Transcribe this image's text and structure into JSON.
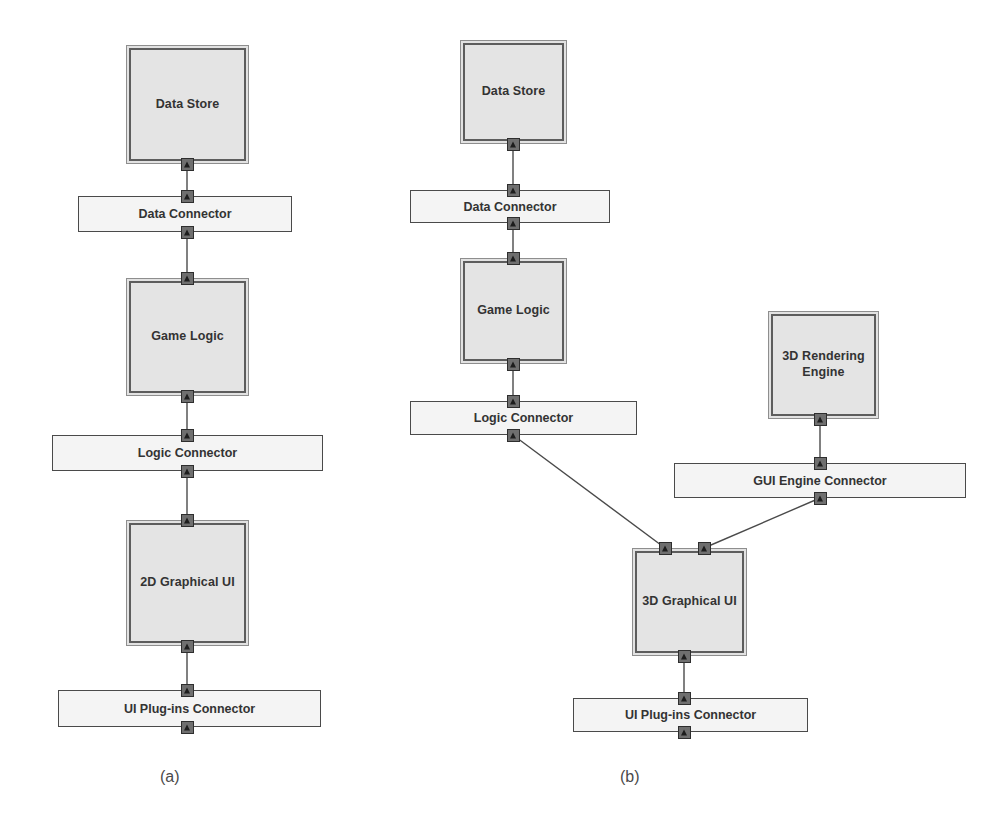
{
  "figure": {
    "background": "#ffffff",
    "component_fill": "#e4e4e4",
    "connector_fill": "#f4f4f4",
    "line_color": "#4a4a4a",
    "port_color": "#6f6f6f"
  },
  "captions": [
    {
      "text": "(a)",
      "x": 160,
      "y": 768
    },
    {
      "text": "(b)",
      "x": 620,
      "y": 768
    }
  ],
  "panels": [
    {
      "id": "panel-a",
      "caption": "(a)",
      "nodes": [
        {
          "id": "a-data-store",
          "kind": "component",
          "label": "Data Store",
          "x": 126,
          "y": 45,
          "w": 123,
          "h": 119,
          "ports": [
            {
              "side": "bottom",
              "cx": 187,
              "cy": 164
            }
          ]
        },
        {
          "id": "a-data-connector",
          "kind": "connector",
          "label": "Data Connector",
          "x": 78,
          "y": 196,
          "w": 214,
          "h": 36,
          "ports": [
            {
              "side": "top",
              "cx": 187,
              "cy": 196
            },
            {
              "side": "bottom",
              "cx": 187,
              "cy": 232
            }
          ]
        },
        {
          "id": "a-game-logic",
          "kind": "component",
          "label": "Game Logic",
          "x": 126,
          "y": 278,
          "w": 123,
          "h": 118,
          "ports": [
            {
              "side": "top",
              "cx": 187,
              "cy": 278
            },
            {
              "side": "bottom",
              "cx": 187,
              "cy": 396
            }
          ]
        },
        {
          "id": "a-logic-connector",
          "kind": "connector",
          "label": "Logic Connector",
          "x": 52,
          "y": 435,
          "w": 271,
          "h": 36,
          "ports": [
            {
              "side": "top",
              "cx": 187,
              "cy": 435
            },
            {
              "side": "bottom",
              "cx": 187,
              "cy": 471
            }
          ]
        },
        {
          "id": "a-2d-graphical-ui",
          "kind": "component",
          "label": "2D Graphical UI",
          "x": 126,
          "y": 520,
          "w": 123,
          "h": 126,
          "ports": [
            {
              "side": "top",
              "cx": 187,
              "cy": 520
            },
            {
              "side": "bottom",
              "cx": 187,
              "cy": 646
            }
          ]
        },
        {
          "id": "a-ui-plugins-connector",
          "kind": "connector",
          "label": "UI Plug-ins Connector",
          "x": 58,
          "y": 690,
          "w": 263,
          "h": 37,
          "ports": [
            {
              "side": "top",
              "cx": 187,
              "cy": 690
            },
            {
              "side": "bottom",
              "cx": 187,
              "cy": 727
            }
          ]
        }
      ],
      "edges": [
        {
          "from": "a-data-store",
          "to": "a-data-connector",
          "x1": 187,
          "y1": 164,
          "x2": 187,
          "y2": 196
        },
        {
          "from": "a-data-connector",
          "to": "a-game-logic",
          "x1": 187,
          "y1": 232,
          "x2": 187,
          "y2": 278
        },
        {
          "from": "a-game-logic",
          "to": "a-logic-connector",
          "x1": 187,
          "y1": 396,
          "x2": 187,
          "y2": 435
        },
        {
          "from": "a-logic-connector",
          "to": "a-2d-graphical-ui",
          "x1": 187,
          "y1": 471,
          "x2": 187,
          "y2": 520
        },
        {
          "from": "a-2d-graphical-ui",
          "to": "a-ui-plugins-connector",
          "x1": 187,
          "y1": 646,
          "x2": 187,
          "y2": 690
        }
      ]
    },
    {
      "id": "panel-b",
      "caption": "(b)",
      "nodes": [
        {
          "id": "b-data-store",
          "kind": "component",
          "label": "Data Store",
          "x": 460,
          "y": 40,
          "w": 107,
          "h": 104,
          "ports": [
            {
              "side": "bottom",
              "cx": 513,
              "cy": 144
            }
          ]
        },
        {
          "id": "b-data-connector",
          "kind": "connector",
          "label": "Data Connector",
          "x": 410,
          "y": 190,
          "w": 200,
          "h": 33,
          "ports": [
            {
              "side": "top",
              "cx": 513,
              "cy": 190
            },
            {
              "side": "bottom",
              "cx": 513,
              "cy": 223
            }
          ]
        },
        {
          "id": "b-game-logic",
          "kind": "component",
          "label": "Game Logic",
          "x": 460,
          "y": 258,
          "w": 107,
          "h": 106,
          "ports": [
            {
              "side": "top",
              "cx": 513,
              "cy": 258
            },
            {
              "side": "bottom",
              "cx": 513,
              "cy": 364
            }
          ]
        },
        {
          "id": "b-logic-connector",
          "kind": "connector",
          "label": "Logic Connector",
          "x": 410,
          "y": 401,
          "w": 227,
          "h": 34,
          "ports": [
            {
              "side": "top",
              "cx": 513,
              "cy": 401
            },
            {
              "side": "bottom",
              "cx": 513,
              "cy": 435
            }
          ]
        },
        {
          "id": "b-3d-rendering-engine",
          "kind": "component",
          "label": "3D Rendering\nEngine",
          "x": 768,
          "y": 311,
          "w": 111,
          "h": 108,
          "ports": [
            {
              "side": "bottom",
              "cx": 820,
              "cy": 419
            }
          ]
        },
        {
          "id": "b-gui-engine-connector",
          "kind": "connector",
          "label": "GUI Engine Connector",
          "x": 674,
          "y": 463,
          "w": 292,
          "h": 35,
          "ports": [
            {
              "side": "top",
              "cx": 820,
              "cy": 463
            },
            {
              "side": "bottom",
              "cx": 820,
              "cy": 498
            }
          ]
        },
        {
          "id": "b-3d-graphical-ui",
          "kind": "component",
          "label": "3D Graphical UI",
          "x": 632,
          "y": 548,
          "w": 115,
          "h": 108,
          "ports": [
            {
              "side": "top",
              "cx": 665,
              "cy": 548
            },
            {
              "side": "top",
              "cx": 704,
              "cy": 548
            },
            {
              "side": "bottom",
              "cx": 684,
              "cy": 656
            }
          ]
        },
        {
          "id": "b-ui-plugins-connector",
          "kind": "connector",
          "label": "UI Plug-ins Connector",
          "x": 573,
          "y": 698,
          "w": 235,
          "h": 34,
          "ports": [
            {
              "side": "top",
              "cx": 684,
              "cy": 698
            },
            {
              "side": "bottom",
              "cx": 684,
              "cy": 732
            }
          ]
        }
      ],
      "edges": [
        {
          "from": "b-data-store",
          "to": "b-data-connector",
          "x1": 513,
          "y1": 144,
          "x2": 513,
          "y2": 190
        },
        {
          "from": "b-data-connector",
          "to": "b-game-logic",
          "x1": 513,
          "y1": 223,
          "x2": 513,
          "y2": 258
        },
        {
          "from": "b-game-logic",
          "to": "b-logic-connector",
          "x1": 513,
          "y1": 364,
          "x2": 513,
          "y2": 401
        },
        {
          "from": "b-logic-connector",
          "to": "b-3d-graphical-ui",
          "x1": 513,
          "y1": 435,
          "x2": 665,
          "y2": 548
        },
        {
          "from": "b-3d-rendering-engine",
          "to": "b-gui-engine-connector",
          "x1": 820,
          "y1": 419,
          "x2": 820,
          "y2": 463
        },
        {
          "from": "b-gui-engine-connector",
          "to": "b-3d-graphical-ui",
          "x1": 820,
          "y1": 498,
          "x2": 704,
          "y2": 548
        },
        {
          "from": "b-3d-graphical-ui",
          "to": "b-ui-plugins-connector",
          "x1": 684,
          "y1": 656,
          "x2": 684,
          "y2": 698
        }
      ]
    }
  ]
}
